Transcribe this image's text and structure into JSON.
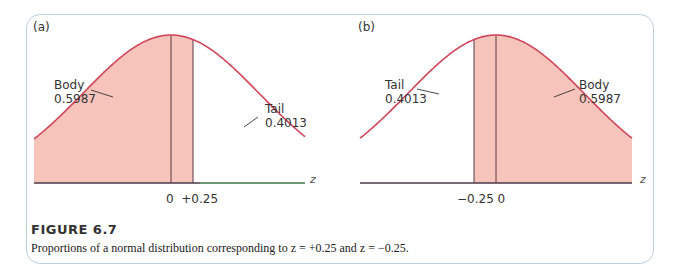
{
  "figure": {
    "title": "FIGURE 6.7",
    "caption": "Proportions of a normal distribution corresponding to z =  +0.25 and z = −0.25."
  },
  "panels": [
    {
      "label": "(a)",
      "body_label": "Body",
      "body_value": "0.5987",
      "tail_label": "Tail",
      "tail_value": "0.4013",
      "ticks": "0  +0.25",
      "axis_label": "z"
    },
    {
      "label": "(b)",
      "body_label": "Body",
      "body_value": "0.5987",
      "tail_label": "Tail",
      "tail_value": "0.4013",
      "ticks": "−0.25 0",
      "axis_label": "z"
    }
  ],
  "colors": {
    "curve": "#d0455a",
    "fill": "#f7c4bc",
    "baseline": "#4a3a48",
    "frame": "#b8d0dc"
  },
  "chart_data": [
    {
      "type": "area",
      "title": "(a)",
      "xlabel": "z",
      "ylabel": "",
      "distribution": "standard normal",
      "z_marks": [
        0,
        0.25
      ],
      "shaded_region": "z < +0.25",
      "annotations": [
        {
          "label": "Body",
          "value": 0.5987,
          "region": "left of z = +0.25"
        },
        {
          "label": "Tail",
          "value": 0.4013,
          "region": "right of z = +0.25"
        }
      ],
      "tick_labels": [
        "0",
        "+0.25"
      ]
    },
    {
      "type": "area",
      "title": "(b)",
      "xlabel": "z",
      "ylabel": "",
      "distribution": "standard normal",
      "z_marks": [
        -0.25,
        0
      ],
      "shaded_region": "z > −0.25",
      "annotations": [
        {
          "label": "Tail",
          "value": 0.4013,
          "region": "left of z = −0.25"
        },
        {
          "label": "Body",
          "value": 0.5987,
          "region": "right of z = −0.25"
        }
      ],
      "tick_labels": [
        "−0.25",
        "0"
      ]
    }
  ]
}
